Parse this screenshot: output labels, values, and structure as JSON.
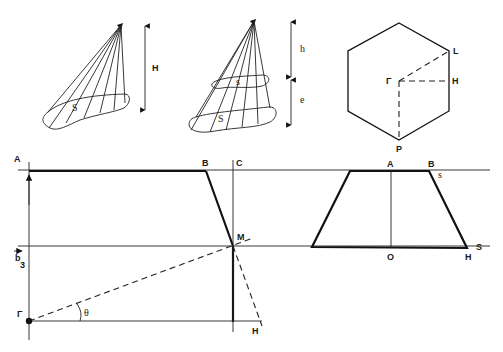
{
  "figure": {
    "panels": {
      "cone_full": {
        "surface_label": "S",
        "height_label": "H"
      },
      "cone_truncated": {
        "small_section_label": "s",
        "large_section_label": "S",
        "upper_height_label": "h",
        "lower_height_label": "e"
      },
      "hexagon": {
        "center_label": "Γ",
        "vertex_label": "L",
        "edge_mid_label": "H",
        "bottom_vertex_label": "P"
      },
      "construction": {
        "top_left_label": "A",
        "top_break_label": "B",
        "vertical_line_label": "C",
        "intersection_label": "M",
        "vector_label": "b",
        "vector_subscript": "3",
        "origin_label": "Γ",
        "angle_label": "θ",
        "dashed_end_label": "H"
      },
      "trapezoid": {
        "top_center_label": "A",
        "top_right_label": "B",
        "top_line_label": "s",
        "bottom_center_label": "O",
        "bottom_right_label": "H",
        "bottom_line_label": "S"
      }
    }
  }
}
